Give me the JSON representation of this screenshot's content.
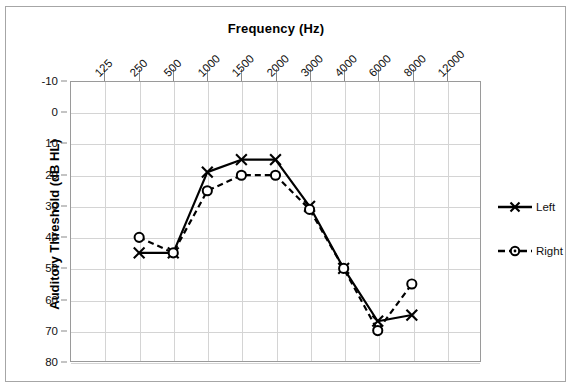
{
  "chart_data": {
    "type": "line",
    "title": "Frequency (Hz)",
    "xlabel": "Frequency (Hz)",
    "ylabel": "Auditory Threshold (dB HL)",
    "categories": [
      "125",
      "250",
      "500",
      "1000",
      "1500",
      "2000",
      "3000",
      "4000",
      "6000",
      "8000",
      "12000"
    ],
    "x_tick_labels": [
      "125",
      "250",
      "500",
      "1000",
      "1500",
      "2000",
      "3000",
      "4000",
      "6000",
      "8000",
      "12000"
    ],
    "y_tick_labels": [
      "-10",
      "0",
      "10",
      "20",
      "30",
      "40",
      "50",
      "60",
      "70",
      "80"
    ],
    "ylim": [
      -10,
      80
    ],
    "y_inverted": true,
    "grid": true,
    "legend_position": "right",
    "series": [
      {
        "name": "Left",
        "marker": "x",
        "line_style": "solid",
        "color": "#000000",
        "x": [
          "250",
          "500",
          "1000",
          "1500",
          "2000",
          "3000",
          "4000",
          "6000",
          "8000"
        ],
        "values": [
          45,
          45,
          19,
          15,
          15,
          30,
          50,
          67,
          65
        ]
      },
      {
        "name": "Right",
        "marker": "circle",
        "line_style": "dashed",
        "color": "#000000",
        "x": [
          "250",
          "500",
          "1000",
          "1500",
          "2000",
          "3000",
          "4000",
          "6000",
          "8000"
        ],
        "values": [
          40,
          45,
          25,
          20,
          20,
          31,
          50,
          70,
          55
        ]
      }
    ]
  },
  "legend": {
    "items": [
      {
        "label": "Left",
        "marker": "x-marker",
        "style": "solid"
      },
      {
        "label": "Right",
        "marker": "circle-marker",
        "style": "dashed"
      }
    ]
  }
}
